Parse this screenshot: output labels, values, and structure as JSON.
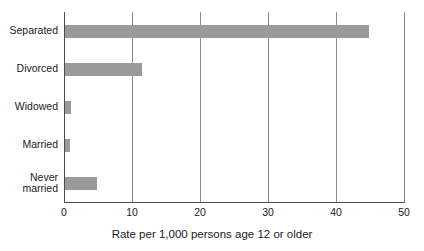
{
  "chart_data": {
    "type": "bar",
    "orientation": "horizontal",
    "title": "",
    "xlabel": "Rate per 1,000 persons age 12 or older",
    "ylabel": "",
    "categories": [
      "Separated",
      "Divorced",
      "Widowed",
      "Married",
      "Never married"
    ],
    "values": [
      44.7,
      11.3,
      0.9,
      0.8,
      4.7
    ],
    "xlim": [
      0,
      50
    ],
    "xticks": [
      0,
      10,
      20,
      30,
      40,
      50
    ],
    "xtick_labels": [
      "0",
      "10",
      "20",
      "30",
      "40",
      "50"
    ],
    "grid": true,
    "grid_axis": "x",
    "legend": false,
    "series": [
      {
        "name": "Rate",
        "values": [
          44.7,
          11.3,
          0.9,
          0.8,
          4.7
        ]
      }
    ],
    "colors": {
      "bar": "#9a9a9a",
      "gridline": "#8a8a8a",
      "axis": "#4d4d4d",
      "text": "#1a1a1a",
      "background": "#ffffff"
    }
  },
  "axis": {
    "x_title": "Rate per 1,000 persons age 12 or older"
  },
  "category_labels": [
    "Separated",
    "Divorced",
    "Widowed",
    "Married",
    "Never\nmarried"
  ]
}
